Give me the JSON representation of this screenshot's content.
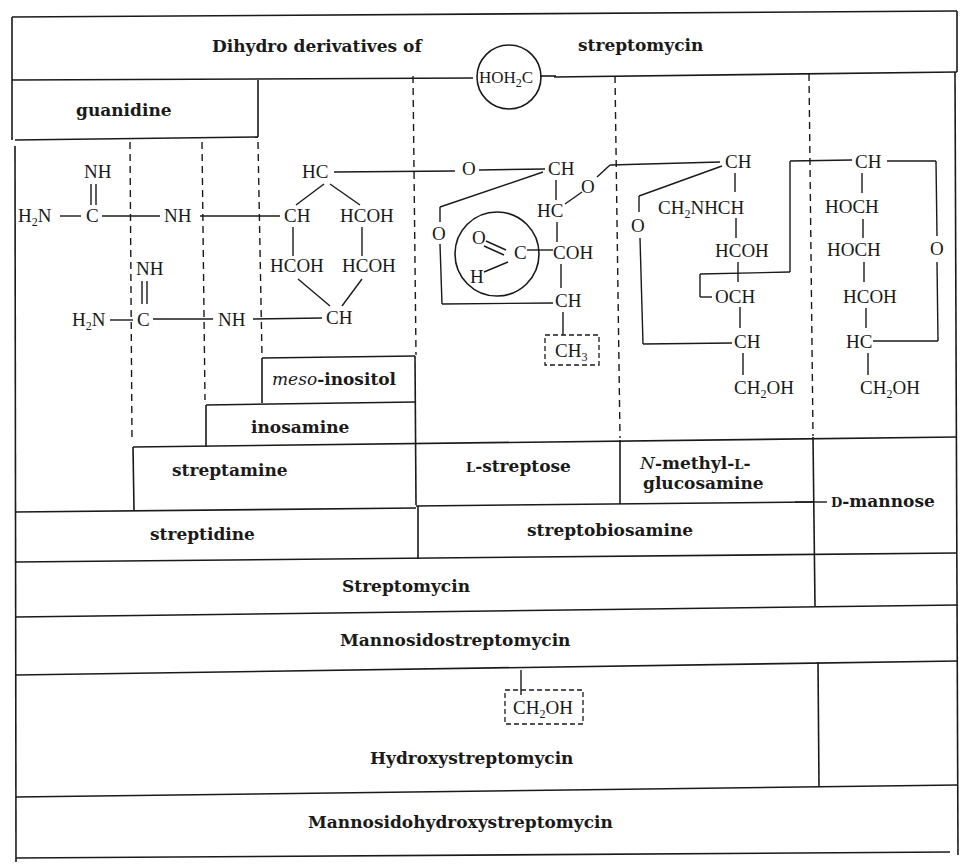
{
  "title": {
    "left": "Dihydro derivatives of",
    "right": "streptomycin",
    "circled_group": "HOH2C"
  },
  "fragments": {
    "guanidine": "guanidine",
    "meso_inositol_italic": "meso",
    "meso_inositol_rest": "-inositol",
    "inosamine": "inosamine",
    "streptamine": "streptamine",
    "l_streptose_prefix": "L",
    "l_streptose_rest": "-streptose",
    "n_methyl_italic": "N",
    "n_methyl_line1_rest": "-methyl-",
    "n_methyl_line1_sc": "L",
    "n_methyl_line1_end": "-",
    "n_methyl_line2": "glucosamine",
    "d_mannose_prefix": "D",
    "d_mannose_rest": "-mannose",
    "streptidine": "streptidine",
    "streptobiosamine": "streptobiosamine"
  },
  "compounds": {
    "streptomycin": "Streptomycin",
    "mannosidostreptomycin": "Mannosidostreptomycin",
    "hydroxystreptomycin": "Hydroxystreptomycin",
    "mannosidohydroxystreptomycin": "Mannosidohydroxystreptomycin"
  },
  "structure": {
    "guanidine_1": {
      "nh": "NH",
      "h2n": "H2N",
      "c": "C",
      "nh_link": "NH"
    },
    "guanidine_2": {
      "nh": "NH",
      "h2n": "H2N",
      "c": "C",
      "nh_link": "NH"
    },
    "inositol_ring": [
      "HC",
      "CH",
      "HCOH",
      "HCOH",
      "HCOH",
      "CH"
    ],
    "streptose": {
      "o_link": "O",
      "ch": "CH",
      "hc": "HC",
      "o_ring": "O",
      "o_bridge": "O",
      "coh": "COH",
      "ch2": "CH",
      "aldehyde_o": "O",
      "aldehyde_c": "C",
      "aldehyde_h": "H",
      "methyl": "CH3"
    },
    "glucosamine": {
      "ch": "CH",
      "ch2nhch": "CH2NHCH",
      "hcoh": "HCOH",
      "och": "OCH",
      "ch2": "CH",
      "ch2oh": "CH2OH",
      "o_ring": "O"
    },
    "mannose": {
      "ch": "CH",
      "hoch1": "HOCH",
      "hoch2": "HOCH",
      "hcoh": "HCOH",
      "hc": "HC",
      "ch2oh": "CH2OH",
      "o_ring": "O"
    },
    "hydroxy_group": "CH2OH"
  }
}
